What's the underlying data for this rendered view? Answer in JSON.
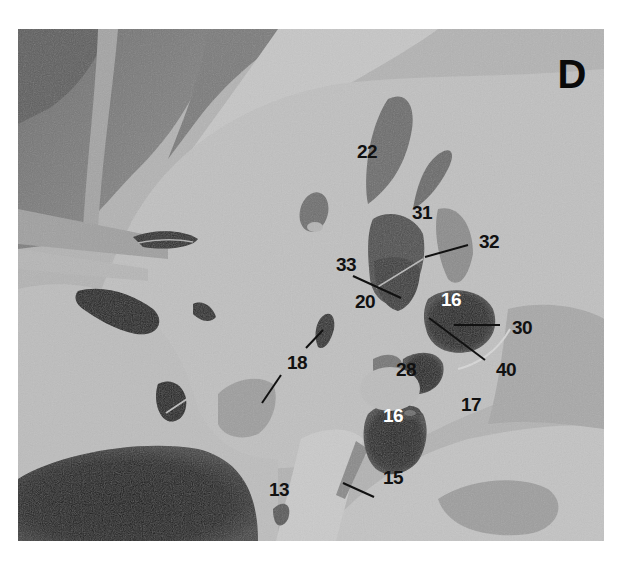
{
  "figure": {
    "panel_letter": "D",
    "colors": {
      "background": "#ffffff",
      "label_dark": "#111111",
      "label_light": "#ffffff",
      "leader_line": "#111111"
    },
    "labels": [
      {
        "id": "22",
        "text": "22",
        "x": 367,
        "y": 151,
        "color": "dark"
      },
      {
        "id": "31",
        "text": "31",
        "x": 422,
        "y": 212,
        "color": "dark"
      },
      {
        "id": "32",
        "text": "32",
        "x": 489,
        "y": 241,
        "color": "dark"
      },
      {
        "id": "33",
        "text": "33",
        "x": 346,
        "y": 264,
        "color": "dark"
      },
      {
        "id": "20",
        "text": "20",
        "x": 365,
        "y": 301,
        "color": "dark"
      },
      {
        "id": "16a",
        "text": "16",
        "x": 451,
        "y": 299,
        "color": "light"
      },
      {
        "id": "30",
        "text": "30",
        "x": 522,
        "y": 327,
        "color": "dark"
      },
      {
        "id": "40",
        "text": "40",
        "x": 506,
        "y": 369,
        "color": "dark"
      },
      {
        "id": "18",
        "text": "18",
        "x": 297,
        "y": 362,
        "color": "dark"
      },
      {
        "id": "28",
        "text": "28",
        "x": 406,
        "y": 369,
        "color": "dark"
      },
      {
        "id": "17",
        "text": "17",
        "x": 471,
        "y": 404,
        "color": "dark"
      },
      {
        "id": "16b",
        "text": "16",
        "x": 393,
        "y": 415,
        "color": "light"
      },
      {
        "id": "15",
        "text": "15",
        "x": 393,
        "y": 477,
        "color": "dark"
      },
      {
        "id": "13",
        "text": "13",
        "x": 279,
        "y": 489,
        "color": "dark"
      }
    ],
    "leader_lines": [
      {
        "label": "32",
        "x1": 468,
        "y1": 245,
        "x2": 425,
        "y2": 257
      },
      {
        "label": "33",
        "x1": 353,
        "y1": 276,
        "x2": 401,
        "y2": 298
      },
      {
        "label": "30",
        "x1": 454,
        "y1": 325,
        "x2": 500,
        "y2": 325
      },
      {
        "label": "40",
        "x1": 429,
        "y1": 318,
        "x2": 485,
        "y2": 360
      },
      {
        "label": "18-upper",
        "x1": 306,
        "y1": 348,
        "x2": 323,
        "y2": 330
      },
      {
        "label": "18-lower",
        "x1": 281,
        "y1": 375,
        "x2": 262,
        "y2": 403
      },
      {
        "label": "15",
        "x1": 343,
        "y1": 483,
        "x2": 374,
        "y2": 497
      }
    ]
  }
}
